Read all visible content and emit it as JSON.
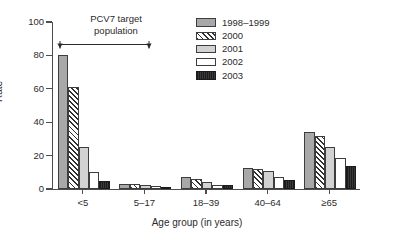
{
  "chart_data": {
    "type": "bar",
    "title": "",
    "xlabel": "Age group (in years)",
    "ylabel": "Rate",
    "ylim": [
      0,
      100
    ],
    "yticks": [
      0,
      20,
      40,
      60,
      80,
      100
    ],
    "grid": false,
    "legend_position": "top-right",
    "categories": [
      "<5",
      "5–17",
      "18–39",
      "40–64",
      "≥65"
    ],
    "series": [
      {
        "name": "1998–1999",
        "pattern": "solid-gray",
        "values": [
          80,
          3.0,
          7.0,
          12.3,
          34.3
        ]
      },
      {
        "name": "2000",
        "pattern": "diagonal-hatch",
        "values": [
          61,
          3.0,
          5.8,
          12.0,
          32.0
        ]
      },
      {
        "name": "2001",
        "pattern": "light-gray",
        "values": [
          25.2,
          2.3,
          4.2,
          11.0,
          25.3
        ]
      },
      {
        "name": "2002",
        "pattern": "white",
        "values": [
          10.3,
          1.7,
          2.7,
          7.0,
          18.8
        ]
      },
      {
        "name": "2003",
        "pattern": "dark-solid",
        "values": [
          5.0,
          1.3,
          2.6,
          5.5,
          13.6
        ]
      }
    ],
    "annotations": [
      {
        "name": "pcv7-bracket",
        "text_line1": "PCV7 target",
        "text_line2": "population"
      }
    ]
  },
  "colors": {
    "series_1998_1999": "#a8a8a8",
    "series_2000": "#2f2f2f",
    "series_2001": "#d2d2d2",
    "series_2002": "#ffffff",
    "series_2003": "#2e2e2e",
    "axis": "#4d4d4d",
    "text": "#2b2b2b",
    "background": "#ffffff"
  }
}
